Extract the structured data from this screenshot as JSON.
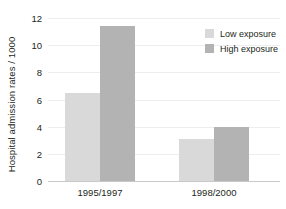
{
  "chart_data": {
    "type": "bar",
    "title": "",
    "subtitle": "",
    "xlabel": "",
    "ylabel": "Hospital admission rates / 1000",
    "categories": [
      "1995/1997",
      "1998/2000"
    ],
    "series": [
      {
        "name": "Low exposure",
        "color": "#d9d9d9",
        "values": [
          6.5,
          3.1
        ]
      },
      {
        "name": "High exposure",
        "color": "#b3b3b3",
        "values": [
          11.4,
          4.0
        ]
      }
    ],
    "ylim": [
      0,
      12
    ],
    "yticks": [
      0,
      2,
      4,
      6,
      8,
      10,
      12
    ],
    "ytick_labels": [
      "0",
      "2",
      "4",
      "6",
      "8",
      "10",
      "12"
    ],
    "grid": "horizontal",
    "grid_color": "#ededed",
    "axis_color": "#c9c9c9",
    "legend_position": "top-right",
    "background": "#ffffff"
  }
}
